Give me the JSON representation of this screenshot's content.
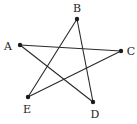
{
  "diagram": {
    "type": "pentagram",
    "points": [
      {
        "id": "A",
        "label": "A",
        "x": 20,
        "y": 45,
        "lx": 8,
        "ly": 50
      },
      {
        "id": "B",
        "label": "B",
        "x": 77,
        "y": 19,
        "lx": 77,
        "ly": 12
      },
      {
        "id": "C",
        "label": "C",
        "x": 121,
        "y": 51,
        "lx": 131,
        "ly": 55
      },
      {
        "id": "D",
        "label": "D",
        "x": 93,
        "y": 102,
        "lx": 95,
        "ly": 118
      },
      {
        "id": "E",
        "label": "E",
        "x": 28,
        "y": 97,
        "lx": 27,
        "ly": 113
      }
    ],
    "segments": [
      {
        "from": "A",
        "to": "C"
      },
      {
        "from": "A",
        "to": "D"
      },
      {
        "from": "B",
        "to": "E"
      },
      {
        "from": "B",
        "to": "D"
      },
      {
        "from": "E",
        "to": "C"
      }
    ],
    "colors": {
      "line": "#2a2a2a",
      "point": "#1a1a1a",
      "label": "#222222"
    }
  }
}
